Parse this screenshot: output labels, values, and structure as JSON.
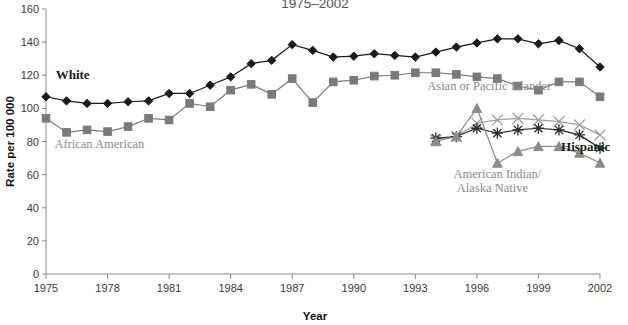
{
  "chart_data": {
    "type": "line",
    "title": "1975–2002",
    "xlabel": "Year",
    "ylabel": "Rate per 100 000",
    "xlim": [
      1975,
      2002
    ],
    "ylim": [
      0,
      160
    ],
    "ytick_values": [
      0,
      20,
      40,
      60,
      80,
      100,
      120,
      140,
      160
    ],
    "ytick_labels": [
      "0",
      "20",
      "40",
      "60",
      "80",
      "100",
      "120",
      "140",
      "160"
    ],
    "xtick_values": [
      1975,
      1978,
      1981,
      1984,
      1987,
      1990,
      1993,
      1996,
      1999,
      2002
    ],
    "xtick_labels": [
      "1975",
      "1978",
      "1981",
      "1984",
      "1987",
      "1990",
      "1993",
      "1996",
      "1999",
      "2002"
    ],
    "grid": false,
    "legend_position": "inline-annotations",
    "series": [
      {
        "name": "White",
        "color": "#1a1a1a",
        "marker": "diamond",
        "label_x": 1976.3,
        "label_y": 118,
        "x": [
          1975,
          1976,
          1977,
          1978,
          1979,
          1980,
          1981,
          1982,
          1983,
          1984,
          1985,
          1986,
          1987,
          1988,
          1989,
          1990,
          1991,
          1992,
          1993,
          1994,
          1995,
          1996,
          1997,
          1998,
          1999,
          2000,
          2001,
          2002
        ],
        "values": [
          107,
          104.5,
          103,
          103,
          104,
          104.5,
          109,
          109,
          114,
          119,
          127,
          129,
          138.5,
          135,
          131,
          131.5,
          133,
          132,
          131,
          134,
          137,
          139.5,
          142,
          142,
          139,
          141,
          136,
          125
        ]
      },
      {
        "name": "African American",
        "color": "#7a7a7a",
        "marker": "square",
        "label_x": 1977.6,
        "label_y": 76,
        "x": [
          1975,
          1976,
          1977,
          1978,
          1979,
          1980,
          1981,
          1982,
          1983,
          1984,
          1985,
          1986,
          1987,
          1988,
          1989,
          1990,
          1991,
          1992,
          1993,
          1994,
          1995,
          1996,
          1997,
          1998,
          1999,
          2000,
          2001,
          2002
        ],
        "values": [
          94,
          85.5,
          87,
          86,
          89,
          94,
          93,
          103,
          101,
          111,
          114.5,
          108.5,
          118,
          103.5,
          116,
          117,
          119.5,
          120,
          121.5,
          121.5,
          120.5,
          119,
          118,
          113.5,
          111,
          116,
          116,
          107
        ]
      },
      {
        "name": "Asian or Pacific Islander",
        "color": "#9e9e9e",
        "marker": "x-cross",
        "label_x": 1996.6,
        "label_y": 111,
        "x": [
          1994,
          1995,
          1996,
          1997,
          1998,
          1999,
          2000,
          2001,
          2002
        ],
        "values": [
          81,
          83,
          91,
          93,
          94,
          93,
          92,
          90,
          84
        ]
      },
      {
        "name": "Hispanic",
        "color": "#2b2b2b",
        "marker": "asterisk",
        "label_x": 2001.3,
        "label_y": 74,
        "x": [
          1994,
          1995,
          1996,
          1997,
          1998,
          1999,
          2000,
          2001,
          2002
        ],
        "values": [
          82,
          83,
          88,
          85,
          87,
          88,
          87,
          84,
          76
        ]
      },
      {
        "name": "American Indian/\nAlaska Native",
        "color": "#8c8c8c",
        "marker": "triangle",
        "label_line1": "American Indian/",
        "label_line2": "Alaska Native",
        "label_x": 1997.0,
        "label_y": 58,
        "x": [
          1994,
          1995,
          1996,
          1997,
          1998,
          1999,
          2000,
          2001,
          2002
        ],
        "values": [
          80,
          83,
          100,
          67,
          74,
          77,
          77,
          73,
          67
        ]
      }
    ]
  }
}
